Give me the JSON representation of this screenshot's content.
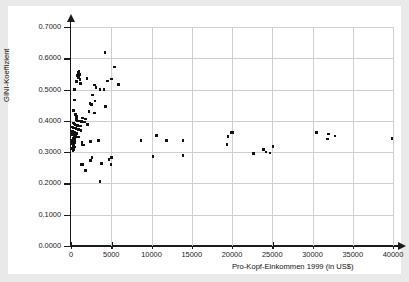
{
  "chart_data": {
    "type": "scatter",
    "title": "",
    "xlabel": "Pro-Kopf-Einkommen 1999 (in US$)",
    "ylabel": "GINI-Koeffizient",
    "xlim": [
      0,
      40000
    ],
    "ylim": [
      0.0,
      0.7
    ],
    "grid": true,
    "legend": null,
    "xticks": [
      0,
      5000,
      10000,
      15000,
      20000,
      25000,
      30000,
      35000,
      40000
    ],
    "xticklabels": [
      "0",
      "5000",
      "10000",
      "15000",
      "20000",
      "25000",
      "30000",
      "35000",
      "40000"
    ],
    "yticks": [
      0.0,
      0.1,
      0.2,
      0.3,
      0.4,
      0.5,
      0.6,
      0.7
    ],
    "yticklabels": [
      "0.0000",
      "0.1000",
      "0.2000",
      "0.3000",
      "0.4000",
      "0.5000",
      "0.6000",
      "0.7000"
    ],
    "marker": "square",
    "marker_color": "#111111",
    "marker_size": 2.6,
    "points": [
      [
        4200,
        0.619
      ],
      [
        5400,
        0.572
      ],
      [
        1000,
        0.56
      ],
      [
        900,
        0.554
      ],
      [
        1050,
        0.548
      ],
      [
        800,
        0.545
      ],
      [
        960,
        0.539
      ],
      [
        1100,
        0.533
      ],
      [
        2000,
        0.536
      ],
      [
        5000,
        0.534
      ],
      [
        700,
        0.525
      ],
      [
        1150,
        0.519
      ],
      [
        4500,
        0.527
      ],
      [
        2900,
        0.515
      ],
      [
        3100,
        0.506
      ],
      [
        4100,
        0.501
      ],
      [
        5900,
        0.516
      ],
      [
        450,
        0.5
      ],
      [
        3600,
        0.5
      ],
      [
        2700,
        0.482
      ],
      [
        400,
        0.467
      ],
      [
        3000,
        0.464
      ],
      [
        2350,
        0.456
      ],
      [
        2550,
        0.453
      ],
      [
        4300,
        0.446
      ],
      [
        300,
        0.433
      ],
      [
        2250,
        0.43
      ],
      [
        2900,
        0.425
      ],
      [
        560,
        0.421
      ],
      [
        650,
        0.413
      ],
      [
        1450,
        0.409
      ],
      [
        1800,
        0.406
      ],
      [
        700,
        0.404
      ],
      [
        820,
        0.4
      ],
      [
        950,
        0.399
      ],
      [
        1300,
        0.398
      ],
      [
        1650,
        0.396
      ],
      [
        250,
        0.393
      ],
      [
        380,
        0.391
      ],
      [
        520,
        0.388
      ],
      [
        780,
        0.386
      ],
      [
        1150,
        0.384
      ],
      [
        2050,
        0.389
      ],
      [
        180,
        0.381
      ],
      [
        330,
        0.377
      ],
      [
        600,
        0.375
      ],
      [
        900,
        0.372
      ],
      [
        1250,
        0.37
      ],
      [
        210,
        0.366
      ],
      [
        420,
        0.363
      ],
      [
        680,
        0.36
      ],
      [
        160,
        0.356
      ],
      [
        350,
        0.353
      ],
      [
        550,
        0.35
      ],
      [
        900,
        0.348
      ],
      [
        230,
        0.344
      ],
      [
        400,
        0.341
      ],
      [
        150,
        0.337
      ],
      [
        320,
        0.334
      ],
      [
        500,
        0.331
      ],
      [
        200,
        0.327
      ],
      [
        380,
        0.324
      ],
      [
        1400,
        0.323
      ],
      [
        1600,
        0.323
      ],
      [
        260,
        0.319
      ],
      [
        430,
        0.316
      ],
      [
        180,
        0.312
      ],
      [
        330,
        0.309
      ],
      [
        1350,
        0.331
      ],
      [
        250,
        0.305
      ],
      [
        2450,
        0.334
      ],
      [
        3400,
        0.338
      ],
      [
        8700,
        0.338
      ],
      [
        10600,
        0.354
      ],
      [
        11900,
        0.337
      ],
      [
        13900,
        0.338
      ],
      [
        19500,
        0.35
      ],
      [
        19900,
        0.362
      ],
      [
        20100,
        0.363
      ],
      [
        19400,
        0.325
      ],
      [
        22700,
        0.295
      ],
      [
        23900,
        0.308
      ],
      [
        24200,
        0.301
      ],
      [
        24700,
        0.297
      ],
      [
        25100,
        0.318
      ],
      [
        30500,
        0.363
      ],
      [
        32000,
        0.358
      ],
      [
        31900,
        0.342
      ],
      [
        32800,
        0.352
      ],
      [
        39900,
        0.343
      ],
      [
        10200,
        0.286
      ],
      [
        13900,
        0.29
      ],
      [
        2600,
        0.283
      ],
      [
        2450,
        0.273
      ],
      [
        1250,
        0.261
      ],
      [
        1450,
        0.26
      ],
      [
        3800,
        0.264
      ],
      [
        4700,
        0.276
      ],
      [
        4950,
        0.26
      ],
      [
        5050,
        0.283
      ],
      [
        1800,
        0.242
      ],
      [
        3600,
        0.207
      ]
    ]
  }
}
